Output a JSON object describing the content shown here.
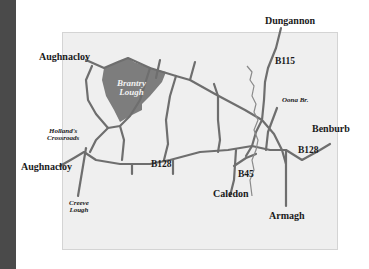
{
  "map": {
    "towns": {
      "aughnacloy_north": "Aughnacloy",
      "aughnacloy_west": "Aughnacloy",
      "dungannon": "Dungannon",
      "benburb": "Benburb",
      "caledon": "Caledon",
      "armagh": "Armagh"
    },
    "roads": {
      "b115": "B115",
      "b128_west": "B128",
      "b128_east": "B128",
      "b45": "B45"
    },
    "places": {
      "hollands_line1": "Holland's",
      "hollands_line2": "Crossroads",
      "creeve_line1": "Creeve",
      "creeve_line2": "Lough",
      "oona": "Oona Br."
    },
    "lake": {
      "line1": "Brantry",
      "line2": "Lough"
    },
    "colors": {
      "road": "#6e6e6e",
      "lake": "#7d7d7d",
      "river": "#8a8a8a",
      "panel": "#efefef",
      "sidebar": "#4a4a4a"
    }
  }
}
